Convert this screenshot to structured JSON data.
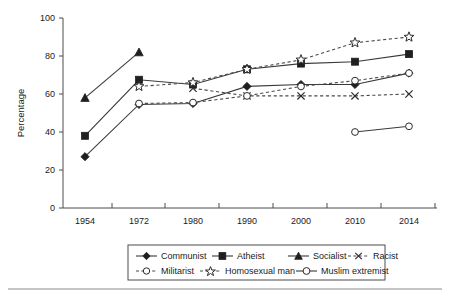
{
  "chart_data": {
    "type": "line",
    "title": "",
    "xlabel": "",
    "ylabel": "Percentage",
    "categories": [
      "1954",
      "1972",
      "1980",
      "1990",
      "2000",
      "2010",
      "2014"
    ],
    "ylim": [
      0,
      100
    ],
    "yticks": [
      "0",
      "20",
      "40",
      "60",
      "80",
      "100"
    ],
    "grid": false,
    "legend_position": "bottom",
    "series": [
      {
        "name": "Communist",
        "marker": "filled-diamond",
        "line": "solid",
        "values": [
          27,
          54.5,
          55,
          64,
          65,
          65,
          71
        ]
      },
      {
        "name": "Atheist",
        "marker": "filled-square",
        "line": "solid",
        "values": [
          38,
          67.5,
          65,
          73,
          76,
          77,
          81
        ]
      },
      {
        "name": "Socialist",
        "marker": "filled-triangle",
        "line": "solid",
        "values": [
          58,
          82,
          null,
          null,
          null,
          null,
          null
        ]
      },
      {
        "name": "Racist",
        "marker": "x",
        "line": "dashed",
        "values": [
          null,
          null,
          63,
          59,
          59,
          59,
          60
        ]
      },
      {
        "name": "Militarist",
        "marker": "open-circle",
        "line": "dashed",
        "values": [
          null,
          55,
          55.5,
          59,
          64,
          67,
          71
        ]
      },
      {
        "name": "Homosexual man",
        "marker": "open-star",
        "line": "dashed",
        "values": [
          null,
          64,
          66,
          73,
          78,
          87,
          90
        ]
      },
      {
        "name": "Muslim extremist",
        "marker": "open-circle",
        "line": "solid",
        "values": [
          null,
          null,
          null,
          null,
          null,
          40,
          43
        ]
      }
    ]
  },
  "legend": {
    "row1": [
      "Communist",
      "Atheist",
      "Socialist",
      "Racist"
    ],
    "row2": [
      "Militarist",
      "Homosexual man",
      "Muslim extremist"
    ]
  }
}
